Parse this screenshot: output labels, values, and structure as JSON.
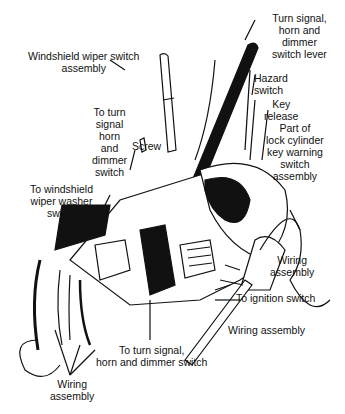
{
  "diagram": {
    "labels": [
      {
        "id": "turn-signal-lever",
        "lines": [
          "Turn signal,",
          "horn and",
          "dimmer",
          "switch lever"
        ]
      },
      {
        "id": "wiper-switch-assembly",
        "lines": [
          "Windshield wiper switch",
          "assembly"
        ]
      },
      {
        "id": "hazard-switch",
        "lines": [
          "Hazard",
          "switch"
        ]
      },
      {
        "id": "key-release",
        "lines": [
          "Key",
          "release"
        ]
      },
      {
        "id": "lock-cylinder-warning",
        "lines": [
          "Part of",
          "lock cylinder",
          "key warning",
          "switch",
          "assembly"
        ]
      },
      {
        "id": "to-turn-signal-horn-dimmer",
        "lines": [
          "To turn",
          "signal",
          "horn",
          "and",
          "dimmer",
          "switch"
        ]
      },
      {
        "id": "screw",
        "lines": [
          "Screw"
        ]
      },
      {
        "id": "to-wiper-washer-switch",
        "lines": [
          "To windshield",
          "wiper washer",
          "switch"
        ]
      },
      {
        "id": "wiring-assembly-right",
        "lines": [
          "Wiring",
          "assembly"
        ]
      },
      {
        "id": "to-ignition-switch",
        "lines": [
          "To ignition switch"
        ]
      },
      {
        "id": "wiring-assembly-bottom-right",
        "lines": [
          "Wiring assembly"
        ]
      },
      {
        "id": "to-turn-signal-bottom",
        "lines": [
          "To turn signal,",
          "horn and dimmer switch"
        ]
      },
      {
        "id": "wiring-assembly-bottom-left",
        "lines": [
          "Wiring",
          "assembly"
        ]
      }
    ]
  }
}
